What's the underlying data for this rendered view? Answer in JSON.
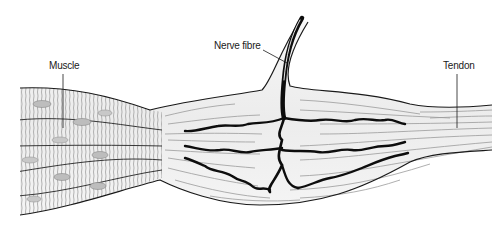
{
  "diagram": {
    "labels": {
      "muscle": "Muscle",
      "nerve_fibre": "Nerve fibre",
      "tendon": "Tendon"
    },
    "regions": [
      "muscle",
      "tendon organ capsule",
      "tendon"
    ],
    "colors": {
      "outline": "#1a1a1a",
      "striation": "#a8a8a8",
      "fibre_line": "#9a9a9a",
      "nerve": "#0d0d0d",
      "fill": "#f2f2f2"
    }
  }
}
